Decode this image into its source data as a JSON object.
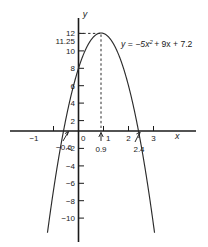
{
  "chart_data": {
    "type": "line",
    "title": "",
    "equation_label": "y = −5x² + 9x + 7.2",
    "function": {
      "a": -5,
      "b": 9,
      "c": 7.2
    },
    "xlabel": "x",
    "ylabel": "y",
    "xlim": [
      -1.55,
      3.45
    ],
    "ylim": [
      -11.7,
      12.6
    ],
    "grid": false,
    "legend": "none",
    "x_ticks": [
      -1,
      0,
      1,
      2,
      3
    ],
    "x_tick_labels": [
      "−1",
      "0",
      "1",
      "2",
      "3"
    ],
    "y_ticks": [
      -10,
      -8,
      -6,
      -4,
      -2,
      2,
      4,
      6,
      8,
      10,
      12
    ],
    "y_tick_labels": [
      "−10",
      "−8",
      "−6",
      "−4",
      "−2",
      "2",
      "4",
      "6",
      "8",
      "10",
      "12"
    ],
    "special_y_label": "11.25",
    "special_y_value": 11.25,
    "annotations": [
      {
        "name": "root-left",
        "label": "−0.6",
        "x": -0.6,
        "y": 0
      },
      {
        "name": "vertex-x",
        "label": "0.9",
        "x": 0.9,
        "y": 0
      },
      {
        "name": "root-right",
        "label": "2.4",
        "x": 2.4,
        "y": 0
      }
    ],
    "vertex": {
      "x": 0.9,
      "y": 11.25
    },
    "roots": [
      -0.6,
      2.4
    ],
    "y_intercept": 7.2,
    "dashed_guides": [
      {
        "name": "vertical-vertex-guide",
        "from": [
          0.9,
          0
        ],
        "to": [
          0.9,
          11.25
        ]
      },
      {
        "name": "horizontal-max-guide",
        "from": [
          0,
          11.25
        ],
        "to": [
          0.9,
          11.25
        ]
      }
    ]
  },
  "labels": {
    "x_axis": "x",
    "y_axis": "y",
    "equation_lhs": "y",
    "equation_eq": "=",
    "equation_term1": "−5x",
    "equation_exp": "2",
    "equation_rest": "+ 9x + 7.2",
    "eleven_twentyfive": "11.25",
    "twelve": "12",
    "ten": "10",
    "eight": "8",
    "six": "6",
    "four": "4",
    "two": "2",
    "zero": "0",
    "neg_two": "−2",
    "neg_four": "−4",
    "neg_six": "−6",
    "neg_eight": "−8",
    "neg_ten": "−10",
    "neg_one": "−1",
    "one": "1",
    "two_x": "2",
    "three": "3",
    "root_left": "−0.6",
    "vertex_x": "0.9",
    "root_right": "2.4"
  },
  "colors": {
    "background": "#ffffff",
    "axis": "#1a1a1a",
    "curve": "#2b2b2b",
    "text": "#1a1a1a"
  }
}
